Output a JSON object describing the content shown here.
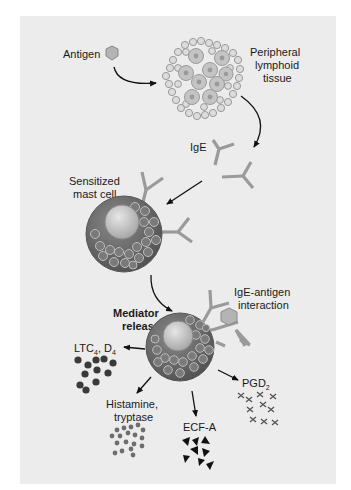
{
  "figure": {
    "background": "#ececec",
    "colors": {
      "text": "#1a1a1a",
      "antigen_fill": "#b4b4b4",
      "antibody": "#9a9a9a",
      "mast_cell_outer": "#6a6a6a",
      "nucleus": "#c8c8c8",
      "granule": "#7c7c7c",
      "leukotriene_dots": "#3a3a3a",
      "histamine_dots": "#6e6e6e",
      "ecf_triangles": "#111111",
      "pgd2_crosses": "#555555",
      "arrow": "#111111"
    }
  },
  "labels": {
    "antigen": "Antigen",
    "lymphoid_line1": "Peripheral",
    "lymphoid_line2": "lymphoid",
    "lymphoid_line3": "tissue",
    "ige": "IgE",
    "mast_line1": "Sensitized",
    "mast_line2": "mast cell",
    "interaction_line1": "IgE-antigen",
    "interaction_line2": "interaction",
    "mediator_line1": "Mediator",
    "mediator_line2": "release",
    "ltc_main": "LTC",
    "ltc_sub1": "4",
    "ltc_mid": ", D",
    "ltc_sub2": "4",
    "histamine_line1": "Histamine,",
    "histamine_line2": "tryptase",
    "ecf": "ECF-A",
    "pgd_main": "PGD",
    "pgd_sub": "2"
  },
  "steps": [
    {
      "from": "antigen",
      "to": "peripheral-lymphoid-tissue"
    },
    {
      "from": "peripheral-lymphoid-tissue",
      "to": "ige"
    },
    {
      "from": "ige",
      "to": "sensitized-mast-cell"
    },
    {
      "from": "sensitized-mast-cell",
      "to": "mediator-release"
    },
    {
      "from": "mediator-release",
      "to": [
        "ltc4-d4",
        "histamine-tryptase",
        "ecf-a",
        "pgd2"
      ]
    }
  ]
}
